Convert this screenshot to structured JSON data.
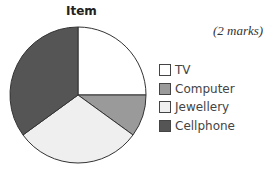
{
  "chart_data": {
    "type": "pie",
    "title": "Item",
    "categories": [
      "TV",
      "Computer",
      "Jewellery",
      "Cellphone"
    ],
    "values": [
      25,
      10,
      30,
      35
    ],
    "unit": "percent (estimated from slice angles)",
    "colors": [
      "#ffffff",
      "#9a9a9a",
      "#efefef",
      "#555555"
    ],
    "start_angle": "12 o'clock, clockwise",
    "legend_position": "right"
  },
  "annotation": "(2 marks)"
}
